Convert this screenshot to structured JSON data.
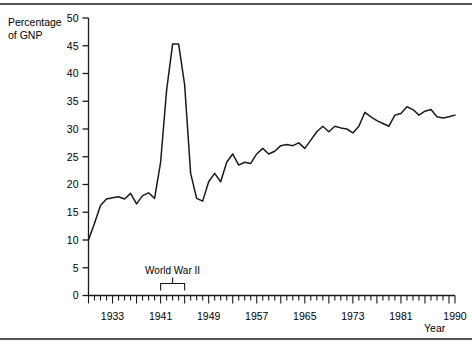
{
  "figure": {
    "ylabel_line1": "Percentage",
    "ylabel_line2": "of GNP",
    "xlabel": "Year"
  },
  "chart_data": {
    "type": "line",
    "title": "",
    "xlabel": "Year",
    "ylabel": "Percentage of GNP",
    "xlim": [
      1929,
      1990
    ],
    "ylim": [
      0,
      50
    ],
    "yticks": [
      0,
      5,
      10,
      15,
      20,
      25,
      30,
      35,
      40,
      45,
      50
    ],
    "xticks_labeled": [
      1933,
      1941,
      1949,
      1957,
      1965,
      1973,
      1981,
      1990
    ],
    "xtick_interval": 1,
    "grid": false,
    "legend": null,
    "annotations": [
      {
        "text": "World War II",
        "type": "bracket",
        "x_start": 1941,
        "x_end": 1945
      }
    ],
    "series": [
      {
        "name": "Percentage of GNP",
        "x": [
          1929,
          1930,
          1931,
          1932,
          1933,
          1934,
          1935,
          1936,
          1937,
          1938,
          1939,
          1940,
          1941,
          1942,
          1943,
          1944,
          1945,
          1946,
          1947,
          1948,
          1949,
          1950,
          1951,
          1952,
          1953,
          1954,
          1955,
          1956,
          1957,
          1958,
          1959,
          1960,
          1961,
          1962,
          1963,
          1964,
          1965,
          1966,
          1967,
          1968,
          1969,
          1970,
          1971,
          1972,
          1973,
          1974,
          1975,
          1976,
          1977,
          1978,
          1979,
          1980,
          1981,
          1982,
          1983,
          1984,
          1985,
          1986,
          1987,
          1988,
          1989,
          1990
        ],
        "y": [
          10.0,
          13.0,
          16.2,
          17.4,
          17.6,
          17.8,
          17.4,
          18.4,
          16.5,
          18.0,
          18.5,
          17.5,
          24.0,
          37.0,
          45.3,
          45.3,
          38.0,
          22.0,
          17.5,
          17.0,
          20.5,
          22.0,
          20.5,
          24.0,
          25.5,
          23.5,
          24.0,
          23.8,
          25.5,
          26.5,
          25.5,
          26.0,
          27.0,
          27.2,
          27.0,
          27.5,
          26.5,
          28.0,
          29.5,
          30.5,
          29.5,
          30.5,
          30.2,
          30.0,
          29.3,
          30.5,
          33.0,
          32.2,
          31.5,
          31.0,
          30.5,
          32.5,
          32.8,
          34.0,
          33.5,
          32.5,
          33.2,
          33.5,
          32.2,
          32.0,
          32.2,
          32.5
        ]
      }
    ]
  }
}
